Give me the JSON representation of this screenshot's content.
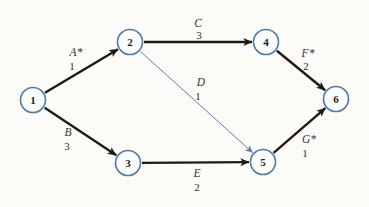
{
  "diagram": {
    "kind": "activity-on-arrow project network",
    "background_color": "#fcfbf7",
    "node_border_color": "#4a7cad",
    "node_fill_color": "#fdfdfa",
    "node_text_color": "#1d1c1a",
    "edge_color_bold": "#1c1b19",
    "edge_color_thin": "#5585b5",
    "label_color": "#34322e",
    "node_radius": 12.5,
    "nodes": [
      {
        "id": "1",
        "x": 33,
        "y": 100
      },
      {
        "id": "2",
        "x": 130,
        "y": 42
      },
      {
        "id": "3",
        "x": 128,
        "y": 163
      },
      {
        "id": "4",
        "x": 266,
        "y": 42
      },
      {
        "id": "5",
        "x": 263,
        "y": 162
      },
      {
        "id": "6",
        "x": 336,
        "y": 99
      }
    ],
    "edges": [
      {
        "activity": "A*",
        "duration": "1",
        "from": "1",
        "to": "2",
        "style": "bold",
        "lx": 76,
        "ly": 56,
        "dx": 72,
        "dy": 70
      },
      {
        "activity": "B",
        "duration": "3",
        "from": "1",
        "to": "3",
        "style": "bold",
        "lx": 68,
        "ly": 136,
        "dx": 67,
        "dy": 150
      },
      {
        "activity": "C",
        "duration": "3",
        "from": "2",
        "to": "4",
        "style": "bold",
        "lx": 198,
        "ly": 27,
        "dx": 199,
        "dy": 39
      },
      {
        "activity": "D",
        "duration": "1",
        "from": "2",
        "to": "5",
        "style": "thin",
        "lx": 201,
        "ly": 86,
        "dx": 198,
        "dy": 100
      },
      {
        "activity": "E",
        "duration": "2",
        "from": "3",
        "to": "5",
        "style": "bold",
        "lx": 197,
        "ly": 177,
        "dx": 197,
        "dy": 191
      },
      {
        "activity": "F*",
        "duration": "2",
        "from": "4",
        "to": "6",
        "style": "bold",
        "lx": 308,
        "ly": 57,
        "dx": 306,
        "dy": 70
      },
      {
        "activity": "G*",
        "duration": "1",
        "from": "5",
        "to": "6",
        "style": "bold",
        "lx": 309,
        "ly": 143,
        "dx": 305,
        "dy": 157
      }
    ]
  }
}
